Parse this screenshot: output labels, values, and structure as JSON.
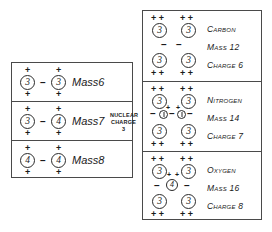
{
  "figure": {
    "background_color": "#ffffff",
    "line_color": "#4a4a4a"
  },
  "left_panel": {
    "name": "lithium-isotopes-panel",
    "rows": [
      {
        "id": "mass6",
        "label": "Mass6",
        "left_nucleon": "3",
        "right_nucleon": "3",
        "separator": "–",
        "top_marks": [
          "+",
          "+"
        ],
        "bottom_marks": [
          "+",
          "+"
        ]
      },
      {
        "id": "mass7",
        "label": "Mass7",
        "left_nucleon": "3",
        "right_nucleon": "4",
        "separator": "–",
        "top_marks": [
          "+",
          "+"
        ],
        "bottom_marks": [
          "+",
          "+"
        ],
        "note_line1": "NUCLEAR",
        "note_line2": "CHARGE",
        "note_line3": "3"
      },
      {
        "id": "mass8",
        "label": "Mass8",
        "left_nucleon": "4",
        "right_nucleon": "4",
        "separator": "–",
        "top_marks": [
          "+",
          "+"
        ],
        "bottom_marks": [
          "+",
          "+"
        ]
      }
    ]
  },
  "right_panel": {
    "name": "elements-panel",
    "rows": [
      {
        "id": "carbon",
        "element": "Carbon",
        "mass": "Mass 12",
        "charge": "Charge 6",
        "top_marks": [
          "+ +",
          "+ +"
        ],
        "bottom_marks": [
          "+ +",
          "+ +"
        ],
        "top_left_nucleon": "3",
        "top_right_nucleon": "3",
        "bottom_left_nucleon": "3",
        "bottom_right_nucleon": "3",
        "middle_marks": [
          "–",
          "–"
        ],
        "middle_core": ""
      },
      {
        "id": "nitrogen",
        "element": "Nitrogen",
        "mass": "Mass 14",
        "charge": "Charge 7",
        "top_marks": [
          "+ +",
          "+ +"
        ],
        "bottom_marks": [
          "+ +",
          "+ +"
        ],
        "top_left_nucleon": "3",
        "top_right_nucleon": "3",
        "bottom_left_nucleon": "3",
        "bottom_right_nucleon": "3",
        "inner_marks": [
          "+",
          "+"
        ],
        "middle_marks": [
          "–",
          "–"
        ],
        "middle_core": "neutron-pair"
      },
      {
        "id": "oxygen",
        "element": "Oxygen",
        "mass": "Mass 16",
        "charge": "Charge 8",
        "top_marks": [
          "+ +",
          "+ +"
        ],
        "bottom_marks": [
          "+ +",
          "+ +"
        ],
        "top_left_nucleon": "3",
        "top_right_nucleon": "3",
        "bottom_left_nucleon": "3",
        "bottom_right_nucleon": "3",
        "inner_marks": [
          "+",
          "+"
        ],
        "middle_marks": [
          "–",
          "–"
        ],
        "middle_core": "4"
      }
    ]
  }
}
